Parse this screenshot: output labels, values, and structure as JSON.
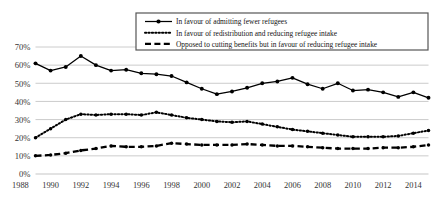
{
  "chart_data": {
    "type": "line",
    "title": "",
    "xlabel": "",
    "ylabel": "",
    "ylim": [
      0,
      70
    ],
    "grid": true,
    "legend_position": "top-right",
    "x": [
      1989,
      1990,
      1991,
      1992,
      1993,
      1994,
      1995,
      1996,
      1997,
      1998,
      1999,
      2000,
      2001,
      2002,
      2003,
      2004,
      2005,
      2006,
      2007,
      2008,
      2009,
      2010,
      2011,
      2012,
      2013,
      2014,
      2015
    ],
    "tick_labels": [
      "1988",
      "1990",
      "1992",
      "1994",
      "1996",
      "1998",
      "2000",
      "2002",
      "2004",
      "2006",
      "2008",
      "2010",
      "2012",
      "2014"
    ],
    "ytick_labels": [
      "0%",
      "10%",
      "20%",
      "30%",
      "40%",
      "50%",
      "60%",
      "70%"
    ],
    "ytick_values": [
      0,
      10,
      20,
      30,
      40,
      50,
      60,
      70
    ],
    "series": [
      {
        "name": "In favour of admitting fewer refugees",
        "style": "solid-marker",
        "color": "#000000",
        "values": [
          61,
          57,
          59,
          65,
          60,
          57,
          57.5,
          55.5,
          55,
          54,
          50.5,
          47,
          44,
          45.5,
          47.5,
          50,
          51,
          53,
          49.5,
          47,
          50,
          46,
          46.5,
          45,
          42.5,
          45,
          42
        ]
      },
      {
        "name": "In favour of redistribution and reducing refugee intake",
        "style": "dotted",
        "color": "#000000",
        "values": [
          20,
          25,
          30,
          33,
          32.5,
          33,
          33,
          32.5,
          34,
          32.5,
          31,
          30,
          29,
          28.5,
          29,
          27.5,
          26,
          24.5,
          23.5,
          22.5,
          21.5,
          20.5,
          20.5,
          20.5,
          21,
          22.5,
          24
        ]
      },
      {
        "name": "Opposed to cutting benefits but in favour of reducing refugee intake",
        "style": "dashed",
        "color": "#000000",
        "values": [
          10,
          10.5,
          11.5,
          13,
          14,
          15.5,
          15,
          15,
          15.5,
          17,
          16.5,
          16,
          16,
          16,
          16.5,
          16,
          15.5,
          15.5,
          15,
          14.5,
          14,
          14,
          14,
          14.5,
          14.5,
          15,
          16
        ]
      }
    ]
  }
}
